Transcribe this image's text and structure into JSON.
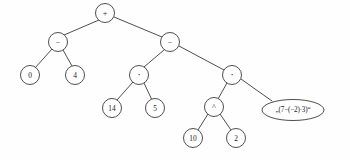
{
  "figure": {
    "name": "expression-tree",
    "background_color": "#fefefe",
    "stroke_color": "#3a3a3a",
    "text_color": "#1c1c1c",
    "width": 350,
    "height": 160
  },
  "nodes": [
    {
      "id": "root",
      "label": "+",
      "kind": "operator",
      "shape": "circle",
      "cx": 105,
      "cy": 13,
      "r": 9.5
    },
    {
      "id": "minus-l",
      "label": "−",
      "kind": "operator",
      "shape": "circle",
      "cx": 58,
      "cy": 42,
      "r": 9.5
    },
    {
      "id": "minus-r",
      "label": "−",
      "kind": "operator",
      "shape": "circle",
      "cx": 170,
      "cy": 42,
      "r": 9.5
    },
    {
      "id": "zero",
      "label": "0",
      "kind": "number",
      "shape": "circle",
      "cx": 30,
      "cy": 75,
      "r": 9.5
    },
    {
      "id": "four",
      "label": "4",
      "kind": "number",
      "shape": "circle",
      "cx": 75,
      "cy": 75,
      "r": 9.5
    },
    {
      "id": "dot-l",
      "label": "·",
      "kind": "operator",
      "shape": "circle",
      "cx": 139,
      "cy": 75,
      "r": 9.5
    },
    {
      "id": "dot-r",
      "label": "·",
      "kind": "operator",
      "shape": "circle",
      "cx": 232,
      "cy": 75,
      "r": 9.5
    },
    {
      "id": "fourteen",
      "label": "14",
      "kind": "number",
      "shape": "circle",
      "cx": 112,
      "cy": 108,
      "r": 9.5
    },
    {
      "id": "five",
      "label": "5",
      "kind": "number",
      "shape": "circle",
      "cx": 155,
      "cy": 108,
      "r": 9.5
    },
    {
      "id": "caret",
      "label": "^",
      "kind": "operator",
      "shape": "circle",
      "cx": 214,
      "cy": 107,
      "r": 9.5
    },
    {
      "id": "ten",
      "label": "10",
      "kind": "number",
      "shape": "circle",
      "cx": 193,
      "cy": 138,
      "r": 9.5
    },
    {
      "id": "two",
      "label": "2",
      "kind": "number",
      "shape": "circle",
      "cx": 236,
      "cy": 138,
      "r": 9.5
    },
    {
      "id": "string",
      "label": "„(7−(−2)·3)“",
      "kind": "string",
      "shape": "ellipse",
      "cx": 293,
      "cy": 110,
      "rx": 31,
      "ry": 10.5
    }
  ],
  "edges": [
    {
      "from": "root",
      "to": "minus-l",
      "x1": 99,
      "y1": 20,
      "x2": 64,
      "y2": 35
    },
    {
      "from": "root",
      "to": "minus-r",
      "x1": 114,
      "y1": 17,
      "x2": 162,
      "y2": 37
    },
    {
      "from": "minus-l",
      "to": "zero",
      "x1": 52,
      "y1": 49,
      "x2": 35,
      "y2": 68
    },
    {
      "from": "minus-l",
      "to": "four",
      "x1": 63,
      "y1": 50,
      "x2": 72,
      "y2": 66
    },
    {
      "from": "minus-r",
      "to": "dot-l",
      "x1": 164,
      "y1": 50,
      "x2": 144,
      "y2": 67
    },
    {
      "from": "minus-r",
      "to": "dot-r",
      "x1": 179,
      "y1": 46,
      "x2": 224,
      "y2": 70
    },
    {
      "from": "dot-l",
      "to": "fourteen",
      "x1": 133,
      "y1": 82,
      "x2": 117,
      "y2": 100
    },
    {
      "from": "dot-l",
      "to": "five",
      "x1": 144,
      "y1": 83,
      "x2": 152,
      "y2": 100
    },
    {
      "from": "dot-r",
      "to": "caret",
      "x1": 227,
      "y1": 83,
      "x2": 218,
      "y2": 99
    },
    {
      "from": "dot-r",
      "to": "string",
      "x1": 241,
      "y1": 79,
      "x2": 272,
      "y2": 101
    },
    {
      "from": "caret",
      "to": "ten",
      "x1": 208,
      "y1": 114,
      "x2": 198,
      "y2": 130
    },
    {
      "from": "caret",
      "to": "two",
      "x1": 220,
      "y1": 114,
      "x2": 231,
      "y2": 130
    }
  ]
}
